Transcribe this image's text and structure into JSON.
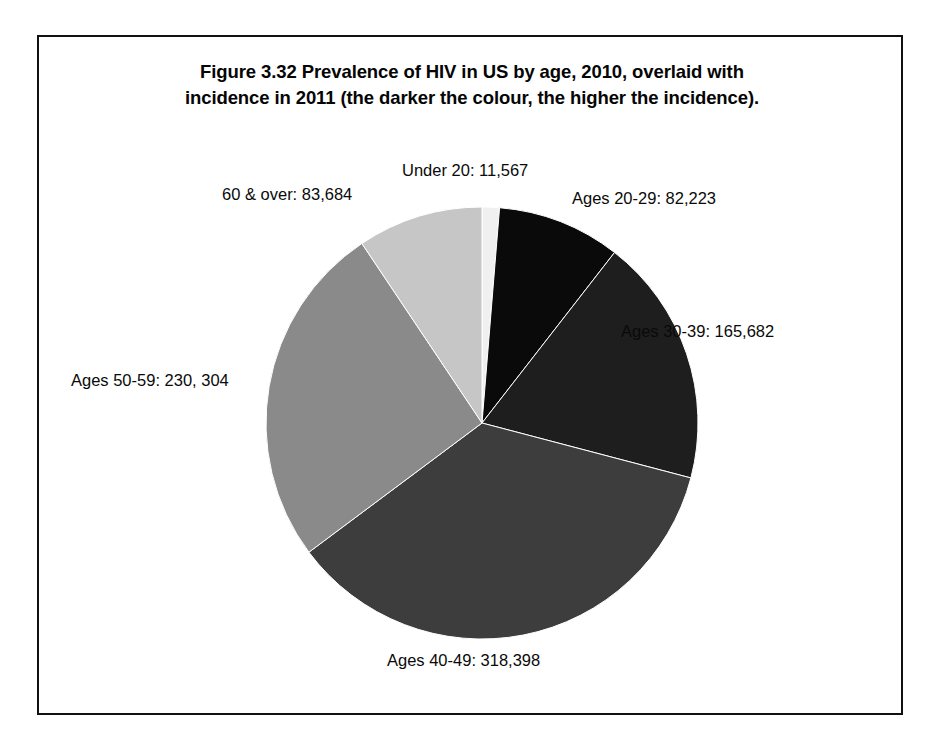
{
  "figure": {
    "caption_line_1": "Figure 3.32   Prevalence of HIV in US by age, 2010, overlaid with",
    "caption_line_2": "incidence in 2011 (the darker the colour, the higher the incidence).",
    "frame_color": "#111111",
    "background_color": "#ffffff"
  },
  "chart_data": {
    "type": "pie",
    "title": "Figure 3.32   Prevalence of HIV in US by age, 2010, overlaid with incidence in 2011 (the darker the colour, the higher the incidence).",
    "xlabel": "",
    "ylabel": "",
    "legend_position": "none",
    "grid": false,
    "start_angle_deg": 0,
    "direction": "clockwise",
    "total": 891858,
    "categories": [
      "Under 20",
      "Ages 20-29",
      "Ages 30-39",
      "Ages 40-49",
      "Ages 50-59",
      "60 & over"
    ],
    "values": [
      11567,
      82223,
      165682,
      318398,
      230304,
      83684
    ],
    "slices": [
      {
        "name": "Under 20",
        "label": "Under 20: 11,567",
        "value": 11567,
        "value_text": "11,567",
        "percent": 1.3,
        "angle_deg": 4.67,
        "color": "#f0f0f0"
      },
      {
        "name": "Ages 20-29",
        "label": "Ages 20-29: 82,223",
        "value": 82223,
        "value_text": "82,223",
        "percent": 9.22,
        "angle_deg": 33.19,
        "color": "#0a0a0a"
      },
      {
        "name": "Ages 30-39",
        "label": "Ages 30-39: 165,682",
        "value": 165682,
        "value_text": "165,682",
        "percent": 18.58,
        "angle_deg": 66.88,
        "color": "#1e1e1e"
      },
      {
        "name": "Ages 40-49",
        "label": "Ages 40-49: 318,398",
        "value": 318398,
        "value_text": "318,398",
        "percent": 35.7,
        "angle_deg": 128.52,
        "color": "#3d3d3d"
      },
      {
        "name": "Ages 50-59",
        "label": "Ages 50-59: 230, 304",
        "value": 230304,
        "value_text": "230, 304",
        "percent": 25.82,
        "angle_deg": 92.97,
        "color": "#8a8a8a"
      },
      {
        "name": "60 & over",
        "label": "60 & over: 83,684",
        "value": 83684,
        "value_text": "83,684",
        "percent": 9.38,
        "angle_deg": 33.78,
        "color": "#c6c6c6"
      }
    ]
  }
}
